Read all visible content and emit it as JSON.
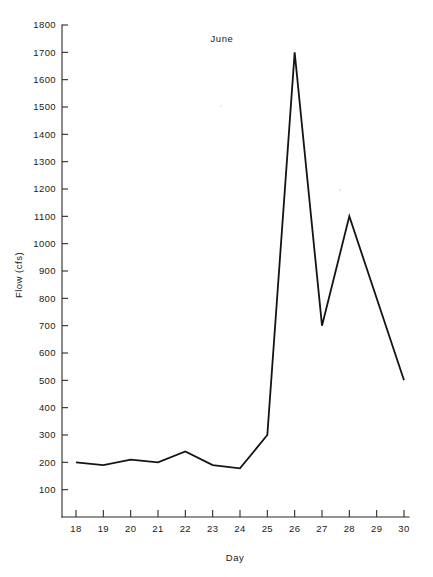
{
  "chart_data": {
    "type": "line",
    "title": "June",
    "xlabel": "Day",
    "ylabel": "Flow (cfs)",
    "x": [
      18,
      19,
      20,
      21,
      22,
      23,
      24,
      25,
      26,
      27,
      28,
      29,
      30
    ],
    "values": [
      200,
      190,
      210,
      200,
      240,
      190,
      178,
      300,
      1700,
      700,
      1100,
      800,
      500
    ],
    "series": [
      {
        "name": "Flow",
        "values": [
          200,
          190,
          210,
          200,
          240,
          190,
          178,
          300,
          1700,
          700,
          1100,
          800,
          500
        ]
      }
    ],
    "xlim": [
      18,
      30
    ],
    "ylim": [
      0,
      1800
    ],
    "xticks": [
      18,
      19,
      20,
      21,
      22,
      23,
      24,
      25,
      26,
      27,
      28,
      29,
      30
    ],
    "xtick_labels": [
      "18",
      "19",
      "20",
      "21",
      "22",
      "23",
      "24",
      "25",
      "26",
      "27",
      "28",
      "29",
      "30"
    ],
    "yticks": [
      100,
      200,
      300,
      400,
      500,
      600,
      700,
      800,
      900,
      1000,
      1100,
      1200,
      1300,
      1400,
      1500,
      1600,
      1700,
      1800
    ],
    "ytick_labels": [
      "100",
      "200",
      "300",
      "400",
      "500",
      "600",
      "700",
      "800",
      "900",
      "1000",
      "1100",
      "1200",
      "1300",
      "1400",
      "1500",
      "1600",
      "1700",
      "1800"
    ],
    "grid": false,
    "legend": null,
    "line_color": "#141414",
    "axis_color": "#2a2a2a",
    "background": "#ffffff"
  }
}
